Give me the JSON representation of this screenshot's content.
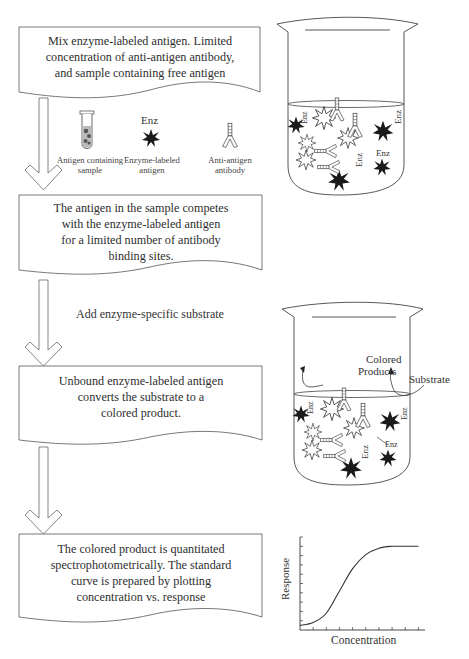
{
  "steps": [
    {
      "lines": [
        "Mix enzyme-labeled antigen. Limited",
        "concentration of anti-antigen antibody,",
        "and sample containing free antigen"
      ]
    },
    {
      "lines": [
        "The antigen in the sample competes",
        "with the enzyme-labeled antigen",
        "for a limited number of antibody",
        "binding sites."
      ]
    },
    {
      "lines": [
        "Unbound enzyme-labeled antigen",
        "converts the substrate to a",
        "colored product."
      ]
    },
    {
      "lines": [
        "The colored product is quantitated",
        "spectrophotometrically. The standard",
        "curve is prepared by plotting",
        "concentration vs. response"
      ]
    }
  ],
  "legend": {
    "sample_label": [
      "Antigen containing",
      "sample"
    ],
    "enzyme_tag": "Enz",
    "enzyme_label": [
      "Enzyme-labeled",
      "antigen"
    ],
    "antibody_label": [
      "Anti-antigen",
      "antibody"
    ]
  },
  "add_substrate_note": "Add enzyme-specific substrate",
  "beaker1": {
    "enz_tags": [
      "Enz",
      "Enz",
      "Enz",
      "Enz"
    ]
  },
  "beaker2": {
    "colored_products": [
      "Colored",
      "Products"
    ],
    "substrate": "Substrate",
    "enz_tags": [
      "Enz",
      "Enz",
      "Enz",
      "Enz"
    ]
  },
  "chart_data": {
    "type": "line",
    "title": "",
    "xlabel": "Concentration",
    "ylabel": "Response",
    "x": [
      0,
      1,
      2,
      3,
      4,
      5,
      6,
      7,
      8,
      9
    ],
    "series": [
      {
        "name": "standard curve",
        "values": [
          0.05,
          0.08,
          0.18,
          0.42,
          0.66,
          0.81,
          0.88,
          0.9,
          0.9,
          0.9
        ]
      }
    ],
    "xlim": [
      0,
      9.5
    ],
    "ylim": [
      0,
      1
    ],
    "x_ticks": 9,
    "y_ticks": 10,
    "grid": false
  }
}
